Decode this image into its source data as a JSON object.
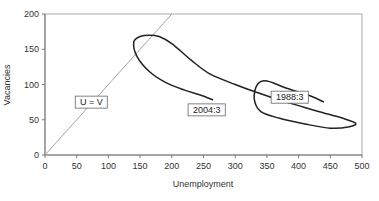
{
  "chart_data": {
    "type": "line",
    "title": "",
    "xlabel": "Unemployment",
    "ylabel": "Vacancies",
    "xlim": [
      0,
      500
    ],
    "ylim": [
      0,
      200
    ],
    "xticks": [
      0,
      50,
      100,
      150,
      200,
      250,
      300,
      350,
      400,
      450,
      500
    ],
    "yticks": [
      0,
      50,
      100,
      150,
      200
    ],
    "grid": false,
    "legend": null,
    "series": [
      {
        "name": "Beveridge curve 1988:3-2004:3",
        "x": [
          440,
          415,
          380,
          350,
          335,
          330,
          340,
          370,
          410,
          450,
          480,
          490,
          470,
          430,
          400,
          370,
          330,
          300,
          260,
          230,
          200,
          180,
          165,
          150,
          140,
          145,
          165,
          190,
          220,
          245,
          265
        ],
        "y": [
          75,
          85,
          95,
          105,
          100,
          80,
          62,
          52,
          44,
          38,
          40,
          45,
          52,
          62,
          70,
          78,
          90,
          100,
          115,
          135,
          158,
          168,
          170,
          168,
          160,
          140,
          118,
          103,
          92,
          85,
          78
        ]
      },
      {
        "name": "U = V",
        "x": [
          0,
          200
        ],
        "y": [
          0,
          200
        ]
      }
    ],
    "annotations": [
      {
        "text": "U = V",
        "x": 73,
        "y": 75
      },
      {
        "text": "1988:3",
        "x": 386,
        "y": 82
      },
      {
        "text": "2004:3",
        "x": 255,
        "y": 64
      }
    ]
  }
}
